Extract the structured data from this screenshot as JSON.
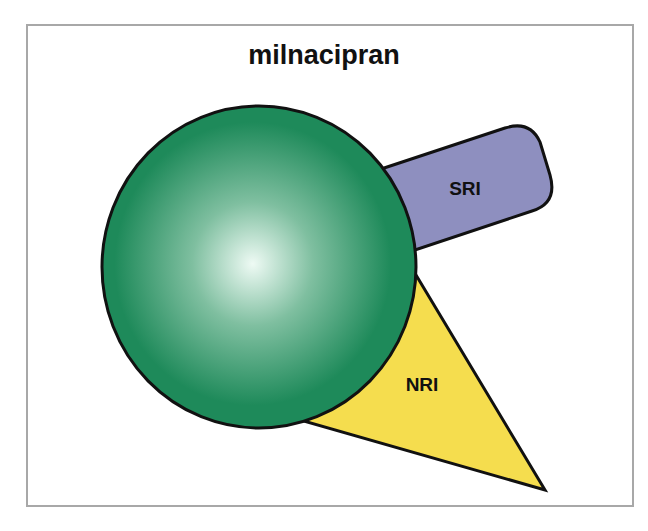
{
  "title": "milnacipran",
  "diagram": {
    "center": {
      "label": "",
      "color": "#1e8a5a",
      "highlight": "#eefaf4"
    },
    "components": [
      {
        "label": "SRI",
        "shape": "rounded-bar",
        "color": "#8e8fbf"
      },
      {
        "label": "NRI",
        "shape": "triangle",
        "color": "#f5dd4e"
      }
    ]
  }
}
